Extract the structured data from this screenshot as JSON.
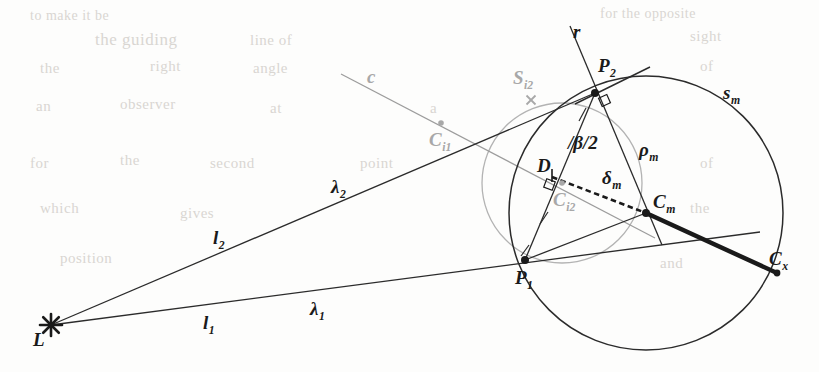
{
  "figure": {
    "width": 819,
    "height": 372,
    "background_color": "#fdfdfc",
    "ink_color": "#262626",
    "gray_ink_color": "#a8a8a8",
    "ghost_color": "#d9d6d2"
  },
  "points": {
    "L": {
      "label": "L",
      "sub": "",
      "x": 51,
      "y": 325,
      "marker": "star",
      "label_x": 33,
      "label_y": 330
    },
    "P1": {
      "label": "P",
      "sub": "1",
      "x": 525,
      "y": 260,
      "marker": "dot-large",
      "label_x": 515,
      "label_y": 268
    },
    "P2": {
      "label": "P",
      "sub": "2",
      "x": 595,
      "y": 93,
      "marker": "dot-large",
      "label_x": 598,
      "label_y": 56
    },
    "Cm": {
      "label": "C",
      "sub": "m",
      "x": 646,
      "y": 213,
      "marker": "dot-large",
      "label_x": 653,
      "label_y": 192
    },
    "Cx": {
      "label": "C",
      "sub": "x",
      "x": 777,
      "y": 273,
      "marker": "dot-med",
      "label_x": 769,
      "label_y": 249
    },
    "Ci1": {
      "label": "C",
      "sub": "i1",
      "x": 441,
      "y": 123,
      "marker": "dot-gray",
      "label_x": 429,
      "label_y": 130,
      "gray": true
    },
    "Ci2": {
      "label": "C",
      "sub": "i2",
      "x": 562,
      "y": 183,
      "marker": "dot-gray",
      "label_x": 553,
      "label_y": 190,
      "gray": true
    },
    "D": {
      "label": "D",
      "sub": "",
      "x": 552,
      "y": 176,
      "marker": "tick",
      "label_x": 537,
      "label_y": 156
    }
  },
  "labels": {
    "r": {
      "text": "r",
      "sub": "",
      "x": 573,
      "y": 22,
      "size": "sz-main"
    },
    "c": {
      "text": "c",
      "sub": "",
      "x": 367,
      "y": 67,
      "size": "sz-main"
    },
    "sm": {
      "text": "s",
      "sub": "m",
      "x": 723,
      "y": 83,
      "size": "sz-main"
    },
    "Si2": {
      "text": "S",
      "sub": "i2",
      "x": 513,
      "y": 68,
      "size": "sz-main",
      "gray": true
    },
    "rho_m": {
      "text": "ρ",
      "sub": "m",
      "x": 639,
      "y": 140,
      "size": "sz-main"
    },
    "delta_m": {
      "text": "δ",
      "sub": "m",
      "x": 602,
      "y": 168,
      "size": "sz-main"
    },
    "beta_2": {
      "text": "/β/2",
      "sub": "",
      "x": 568,
      "y": 133,
      "size": "sz-main"
    },
    "lambda2": {
      "text": "λ",
      "sub": "2",
      "x": 331,
      "y": 177,
      "size": "sz-main"
    },
    "lambda1": {
      "text": "λ",
      "sub": "1",
      "x": 310,
      "y": 299,
      "size": "sz-main"
    },
    "l2": {
      "text": "l",
      "sub": "2",
      "x": 213,
      "y": 228,
      "size": "sz-main"
    },
    "l1": {
      "text": "l",
      "sub": "1",
      "x": 203,
      "y": 313,
      "size": "sz-main"
    }
  },
  "geometry": {
    "circle_sm": {
      "cx": 646,
      "cy": 213,
      "r": 137,
      "stroke": "#2b2b2b",
      "width": 1.5,
      "name": "circle-sm"
    },
    "circle_si2": {
      "cx": 562,
      "cy": 183,
      "r": 80,
      "stroke": "#b3b3b3",
      "width": 1.3,
      "name": "circle-si2"
    },
    "line_l2_lambda2": {
      "x1": 51,
      "y1": 325,
      "x2": 595,
      "y2": 93,
      "name": "ray-l2-lambda2"
    },
    "line_l1_lambda1": {
      "x1": 51,
      "y1": 325,
      "x2": 760,
      "y2": 232,
      "name": "ray-l1-lambda1"
    },
    "line_r": {
      "x1": 570,
      "y1": 26,
      "x2": 662,
      "y2": 245,
      "name": "line-r"
    },
    "line_c": {
      "x1": 341,
      "y1": 74,
      "x2": 655,
      "y2": 238,
      "name": "line-c"
    },
    "tangent_p2": {
      "x1": 650,
      "y1": 67,
      "x2": 575,
      "y2": 104,
      "name": "tangent-at-p2"
    },
    "chord_p1_cm": {
      "x1": 525,
      "y1": 260,
      "x2": 646,
      "y2": 213,
      "name": "segment-p1-cm"
    },
    "chord_p1_p2": {
      "x1": 525,
      "y1": 260,
      "x2": 595,
      "y2": 93,
      "name": "segment-p1-p2"
    },
    "radius_p2_cm": {
      "x1": 595,
      "y1": 93,
      "x2": 646,
      "y2": 213,
      "name": "radius-rho-m"
    },
    "thick_cm_cx": {
      "x1": 646,
      "y1": 213,
      "x2": 777,
      "y2": 273,
      "name": "segment-cm-cx",
      "width": 4.5
    },
    "dashed_d_cm": {
      "x1": 552,
      "y1": 177,
      "x2": 646,
      "y2": 213,
      "name": "segment-delta-m-dashed"
    },
    "x_marker": {
      "x": 531,
      "y": 100,
      "size": 9,
      "name": "x-marker",
      "gray": true
    },
    "right_angle_p2": {
      "x": 600,
      "y": 96,
      "size": 9,
      "rot": -24,
      "name": "right-angle-p2"
    },
    "right_angle_d": {
      "x": 545,
      "y": 180,
      "size": 9,
      "rot": 20,
      "name": "right-angle-d"
    },
    "tick_p1": {
      "x1": 529,
      "y1": 245,
      "x2": 521,
      "y2": 256,
      "name": "tick-mark-p1"
    },
    "tick_mid": {
      "x1": 548,
      "y1": 212,
      "x2": 540,
      "y2": 224,
      "name": "tick-mark-midsegment"
    },
    "tick_p2a": {
      "x1": 586,
      "y1": 108,
      "x2": 579,
      "y2": 121,
      "name": "tick-mark-p2"
    }
  },
  "ghost_text": [
    {
      "text": "to make it be",
      "x": 30,
      "y": 8,
      "size": 14
    },
    {
      "text": "for the opposite",
      "x": 600,
      "y": 6,
      "size": 14
    },
    {
      "text": "the guiding",
      "x": 95,
      "y": 30,
      "size": 17
    },
    {
      "text": "line of",
      "x": 250,
      "y": 32,
      "size": 15
    },
    {
      "text": "sight",
      "x": 690,
      "y": 28,
      "size": 15
    },
    {
      "text": "the",
      "x": 40,
      "y": 60,
      "size": 15
    },
    {
      "text": "right",
      "x": 150,
      "y": 58,
      "size": 15
    },
    {
      "text": "angle",
      "x": 253,
      "y": 60,
      "size": 15
    },
    {
      "text": "of",
      "x": 700,
      "y": 58,
      "size": 15
    },
    {
      "text": "an",
      "x": 36,
      "y": 98,
      "size": 15
    },
    {
      "text": "observer",
      "x": 120,
      "y": 96,
      "size": 15
    },
    {
      "text": "at",
      "x": 270,
      "y": 100,
      "size": 15
    },
    {
      "text": "a",
      "x": 430,
      "y": 100,
      "size": 15
    },
    {
      "text": "for",
      "x": 30,
      "y": 155,
      "size": 15
    },
    {
      "text": "the",
      "x": 120,
      "y": 152,
      "size": 15
    },
    {
      "text": "second",
      "x": 210,
      "y": 155,
      "size": 15
    },
    {
      "text": "point",
      "x": 360,
      "y": 155,
      "size": 15
    },
    {
      "text": "of",
      "x": 700,
      "y": 155,
      "size": 15
    },
    {
      "text": "which",
      "x": 40,
      "y": 200,
      "size": 15
    },
    {
      "text": "gives",
      "x": 180,
      "y": 205,
      "size": 15
    },
    {
      "text": "the",
      "x": 690,
      "y": 200,
      "size": 15
    },
    {
      "text": "position",
      "x": 60,
      "y": 250,
      "size": 15
    },
    {
      "text": "and",
      "x": 660,
      "y": 255,
      "size": 15
    }
  ]
}
